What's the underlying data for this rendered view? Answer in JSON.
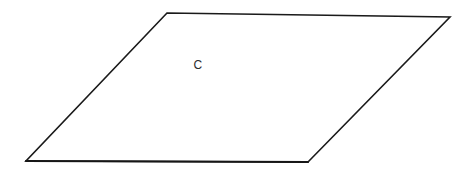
{
  "figure": {
    "background_color": "#ffffff",
    "stroke_color": "#1a1a1a",
    "stroke_width": 1.6,
    "canvas": {
      "width": 467,
      "height": 180
    },
    "shape": {
      "name": "parallelogram",
      "fill_color": "#ffffff",
      "vertices": [
        {
          "id": "top-left",
          "x": 167,
          "y": 13
        },
        {
          "id": "top-right",
          "x": 450,
          "y": 17
        },
        {
          "id": "bottom-right",
          "x": 308,
          "y": 162
        },
        {
          "id": "bottom-left",
          "x": 26,
          "y": 161
        }
      ],
      "points_attr": "167,13 450,17 308,162 26,161",
      "bottom_edge_attr": "M 26,161 L 308,162"
    },
    "labels": [
      {
        "id": "region-label-c",
        "text": "C",
        "x": 198,
        "y": 65,
        "color": "#2b2b2b",
        "font_size_px": 12
      }
    ]
  }
}
